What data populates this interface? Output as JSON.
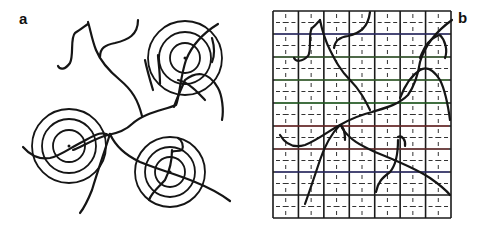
{
  "panels": [
    {
      "id": "a",
      "label": "a",
      "description": "Branching fibers with three sets of concentric rings",
      "ring_sets": [
        {
          "cx": 185,
          "cy": 58,
          "radii": [
            15,
            26,
            37
          ]
        },
        {
          "cx": 69,
          "cy": 146,
          "radii": [
            16,
            27,
            37
          ]
        },
        {
          "cx": 170,
          "cy": 172,
          "radii": [
            15,
            25,
            35
          ]
        }
      ],
      "curves": [
        "M 73 150 C 80 148, 95 138, 108 135 C 118 133, 126 130, 132 124 C 145 112, 165 110, 176 105 C 180 95, 180 78, 186 60 C 192 45, 205 32, 218 24",
        "M 23 147 C 30 155, 38 160, 50 158 C 60 156, 70 148, 82 142 C 95 135, 102 130, 110 136",
        "M 110 134 C 105 150, 98 170, 92 190 C 88 200, 84 208, 80 213",
        "M 110 134 C 115 145, 125 155, 140 162 C 160 170, 178 175, 195 182 C 210 188, 222 195, 230 201",
        "M 142 116 C 138 100, 132 90, 120 80 C 108 70, 100 60, 96 50 C 92 40, 90 28, 88 22",
        "M 100 57 C 100 48, 105 45, 115 43 C 128 40, 138 35, 138 20",
        "M 88 24 C 85 26, 80 30, 75 33 C 70 38, 74 55, 70 63 C 65 70, 60 70, 58 66",
        "M 174 107 C 176 100, 180 92, 185 80 C 195 72, 208 70, 218 88 C 222 95, 224 110, 222 120",
        "M 178 80 C 190 82, 200 95, 205 100",
        "M 160 84 C 160 70, 158 60, 158 55",
        "M 153 90 C 150 80, 147 70, 145 60",
        "M 212 38 C 214 45, 215 55, 212 62",
        "M 172 150 C 172 160, 170 170, 165 180 C 158 188, 152 192, 149 200",
        "M 178 138 C 182 140, 184 146, 182 150 C 178 152, 174 150, 172 152"
      ]
    },
    {
      "id": "b",
      "label": "b",
      "description": "Same fiber network overlaid on a 7x9 square grid with dashed subdivisions",
      "grid": {
        "x": 273,
        "y": 11,
        "width": 178,
        "height": 207,
        "cols": 7,
        "rows": 9
      },
      "colored_lines": [
        {
          "y": 34,
          "color": "#3a3aa8"
        },
        {
          "y": 57,
          "color": "#4a8a3a"
        },
        {
          "y": 80,
          "color": "#4a9a3a"
        },
        {
          "y": 103,
          "color": "#2a9a2a"
        },
        {
          "y": 126,
          "color": "#b03030"
        },
        {
          "y": 149,
          "color": "#a03a3a"
        },
        {
          "y": 172,
          "color": "#3a3aa8"
        }
      ],
      "curves": [
        "M 305 204 C 310 190, 315 175, 320 160 C 325 145, 330 135, 340 125 C 352 118, 360 115, 372 112 C 385 108, 398 105, 408 95 C 415 85, 418 75, 420 62 C 425 45, 438 30, 452 20",
        "M 280 135 C 286 145, 295 148, 305 145 C 318 140, 330 130, 340 125 C 345 128, 345 135, 345 140",
        "M 342 128 C 350 140, 360 145, 375 152 C 395 160, 415 168, 430 178 C 440 185, 446 190, 450 195",
        "M 370 110 C 365 100, 360 90, 350 80 C 340 70, 335 60, 330 50 C 325 40, 322 30, 320 20",
        "M 334 48 C 335 40, 340 37, 348 36 C 360 33, 368 28, 370 12",
        "M 320 20 C 318 22, 315 26, 312 28 C 308 33, 312 50, 308 56 C 302 62, 296 62, 294 58",
        "M 400 98 C 405 85, 412 75, 420 70 C 428 65, 435 72, 440 80 C 445 90, 448 105, 450 120",
        "M 420 58 C 425 45, 430 38, 440 35 C 445 40, 448 50, 445 58",
        "M 398 140 C 398 155, 396 165, 390 172 C 382 178, 378 182, 376 192",
        "M 398 137 C 402 135, 406 140, 405 146"
      ]
    }
  ]
}
